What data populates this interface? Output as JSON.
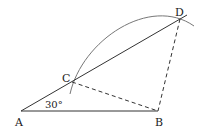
{
  "diagram": {
    "points": {
      "A": "A",
      "B": "B",
      "C": "C",
      "D": "D"
    },
    "angle_label": "30°",
    "segments": [
      {
        "from": "A",
        "to": "B",
        "style": "solid"
      },
      {
        "from": "A",
        "to": "D",
        "style": "solid"
      },
      {
        "from": "C",
        "to": "B",
        "style": "dashed"
      },
      {
        "from": "D",
        "to": "B",
        "style": "dashed"
      }
    ],
    "arc": {
      "through": [
        "C",
        "D"
      ],
      "style": "solid"
    },
    "colors": {
      "line": "#333333",
      "arc": "#777777"
    }
  }
}
